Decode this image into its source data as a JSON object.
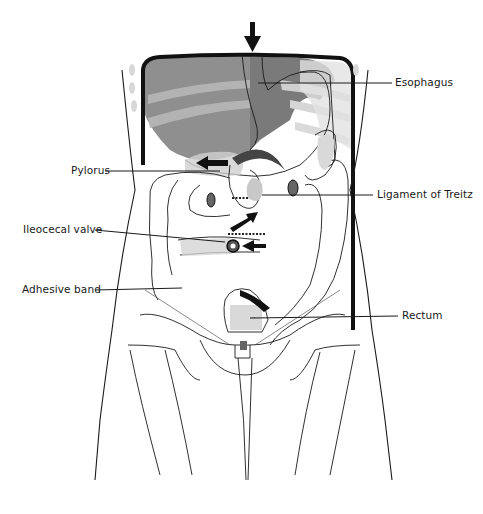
{
  "figure": {
    "labels": {
      "esophagus": "Esophagus",
      "pylorus": "Pylorus",
      "ligament_of_treitz": "Ligament of Treitz",
      "ileocecal_valve": "Ileocecal valve",
      "adhesive_band": "Adhesive band",
      "rectum": "Rectum"
    },
    "colors": {
      "outline": "#1a1a1a",
      "shade_dark": "#7a7a7a",
      "shade_mid": "#9e9e9e",
      "shade_light": "#d4d4d4",
      "background": "#ffffff"
    },
    "arrows": [
      {
        "name": "esophagus-entry-arrow",
        "direction": "down"
      },
      {
        "name": "stomach-arrow",
        "direction": "left"
      },
      {
        "name": "duodenum-arrow",
        "direction": "up-right"
      },
      {
        "name": "ileum-arrow",
        "direction": "left"
      }
    ]
  }
}
